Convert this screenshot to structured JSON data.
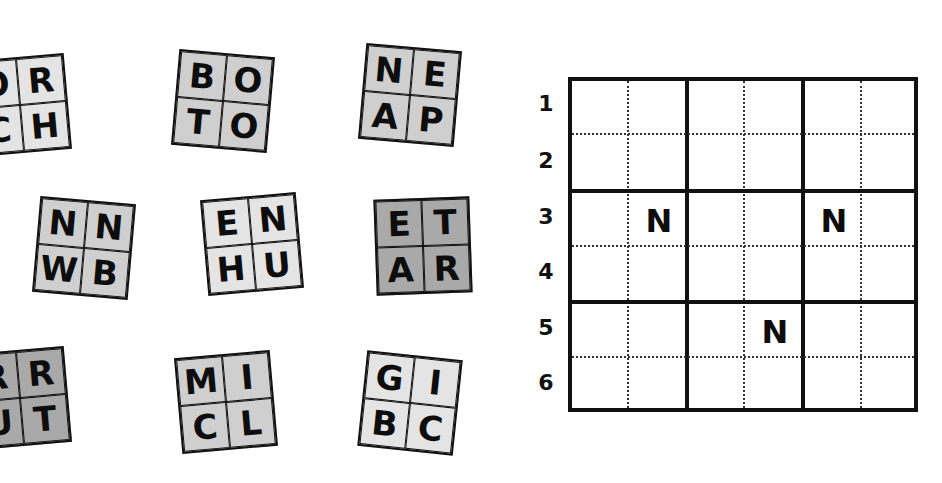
{
  "tiles": [
    {
      "letters": [
        "O",
        "R",
        "C",
        "H"
      ],
      "shade": "light"
    },
    {
      "letters": [
        "B",
        "O",
        "T",
        "O"
      ],
      "shade": "mid"
    },
    {
      "letters": [
        "N",
        "E",
        "A",
        "P"
      ],
      "shade": "mid"
    },
    {
      "letters": [
        "N",
        "N",
        "W",
        "B"
      ],
      "shade": "mid"
    },
    {
      "letters": [
        "E",
        "N",
        "H",
        "U"
      ],
      "shade": "light"
    },
    {
      "letters": [
        "E",
        "T",
        "A",
        "R"
      ],
      "shade": "dark"
    },
    {
      "letters": [
        "R",
        "R",
        "U",
        "T"
      ],
      "shade": "dark"
    },
    {
      "letters": [
        "M",
        "I",
        "C",
        "L"
      ],
      "shade": "mid"
    },
    {
      "letters": [
        "G",
        "I",
        "B",
        "C"
      ],
      "shade": "light"
    }
  ],
  "grid": {
    "row_labels": [
      "1",
      "2",
      "3",
      "4",
      "5",
      "6"
    ],
    "given_letters": [
      {
        "row": 3,
        "col": 2,
        "letter": "N"
      },
      {
        "row": 3,
        "col": 5,
        "letter": "N"
      },
      {
        "row": 5,
        "col": 4,
        "letter": "N"
      }
    ]
  }
}
